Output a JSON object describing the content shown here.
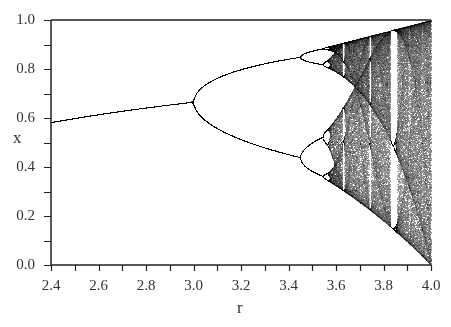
{
  "chart_data": {
    "type": "scatter",
    "title": "",
    "subtitle": "Bifurcation diagram of the logistic map x(n+1) = r·x(n)·(1 − x(n))",
    "xlabel": "r",
    "ylabel": "x",
    "xlim": [
      2.4,
      4.0
    ],
    "ylim": [
      0.0,
      1.0
    ],
    "x_ticks": [
      "2.4",
      "2.6",
      "2.8",
      "3.0",
      "3.2",
      "3.4",
      "3.6",
      "3.8",
      "4.0"
    ],
    "x_minor_ticks_step": 0.1,
    "y_ticks": [
      "0.0",
      "0.2",
      "0.4",
      "0.6",
      "0.8",
      "1.0"
    ],
    "y_minor_ticks_step": 0.1,
    "grid": false,
    "legend": null,
    "series": [
      {
        "name": "logistic map attractor",
        "generator": {
          "map": "logistic",
          "r_min": 2.4,
          "r_max": 4.0,
          "transient": 300,
          "samples": 260
        },
        "color": "#000000"
      }
    ],
    "annotations": {
      "fixed_point_at_r_2_4": 0.583,
      "first_bifurcation_r": 3.0,
      "fixed_point_at_r_3_0": 0.667,
      "second_bifurcation_r": 3.449,
      "onset_of_chaos_r": 3.57,
      "period3_window_r": 3.83
    }
  },
  "axes": {
    "x_title": "r",
    "y_title": "x"
  }
}
